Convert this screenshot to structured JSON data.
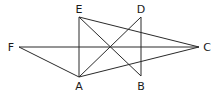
{
  "diagram": {
    "points": {
      "A": {
        "label": "A",
        "x": 79,
        "y": 77,
        "lx": 79,
        "ly": 90
      },
      "B": {
        "label": "B",
        "x": 141,
        "y": 76,
        "lx": 141,
        "ly": 90
      },
      "C": {
        "label": "C",
        "x": 199,
        "y": 47,
        "lx": 207,
        "ly": 51
      },
      "D": {
        "label": "D",
        "x": 141,
        "y": 17,
        "lx": 141,
        "ly": 13
      },
      "E": {
        "label": "E",
        "x": 79,
        "y": 17,
        "lx": 79,
        "ly": 13
      },
      "F": {
        "label": "F",
        "x": 19,
        "y": 47,
        "lx": 11,
        "ly": 51
      }
    },
    "segments": [
      [
        "E",
        "A"
      ],
      [
        "D",
        "B"
      ],
      [
        "E",
        "C"
      ],
      [
        "E",
        "B"
      ],
      [
        "A",
        "D"
      ],
      [
        "A",
        "C"
      ],
      [
        "F",
        "C"
      ],
      [
        "F",
        "A"
      ]
    ],
    "line_color": "#2a2a2a"
  }
}
